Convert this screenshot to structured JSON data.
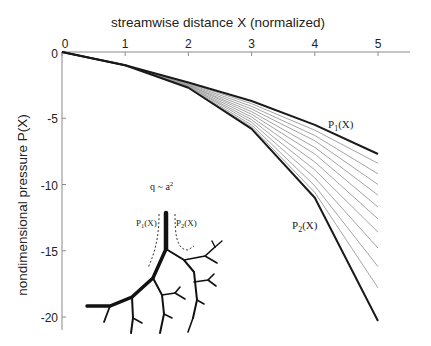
{
  "chart_data": {
    "type": "line",
    "title": "",
    "xlabel": "streamwise distance X (normalized)",
    "ylabel": "nondimensional pressure P(X)",
    "xlim": [
      0,
      5
    ],
    "ylim": [
      -21,
      0
    ],
    "x_ticks": [
      "0",
      "1",
      "2",
      "3",
      "4",
      "5"
    ],
    "y_ticks": [
      "0",
      "-5",
      "-10",
      "-15",
      "-20"
    ],
    "grid": false,
    "x_axis_position": "top",
    "x": [
      0,
      1,
      2,
      3,
      4,
      5
    ],
    "series": [
      {
        "name": "P1(X)",
        "style": "bold",
        "values": [
          0,
          -1.0,
          -2.3,
          -3.7,
          -5.5,
          -7.7
        ]
      },
      {
        "name": "intermediate-1",
        "style": "thin-gray",
        "values": [
          0,
          -1.0,
          -2.35,
          -3.9,
          -5.9,
          -8.4
        ]
      },
      {
        "name": "intermediate-2",
        "style": "thin-gray",
        "values": [
          0,
          -1.0,
          -2.4,
          -4.1,
          -6.3,
          -9.2
        ]
      },
      {
        "name": "intermediate-3",
        "style": "thin-gray",
        "values": [
          0,
          -1.0,
          -2.45,
          -4.3,
          -6.7,
          -10.0
        ]
      },
      {
        "name": "intermediate-4",
        "style": "thin-gray",
        "values": [
          0,
          -1.0,
          -2.5,
          -4.5,
          -7.2,
          -10.8
        ]
      },
      {
        "name": "intermediate-5",
        "style": "thin-gray",
        "values": [
          0,
          -1.0,
          -2.5,
          -4.7,
          -7.7,
          -11.7
        ]
      },
      {
        "name": "intermediate-6",
        "style": "thin-gray",
        "values": [
          0,
          -1.0,
          -2.55,
          -4.9,
          -8.3,
          -12.6
        ]
      },
      {
        "name": "intermediate-7",
        "style": "thin-gray",
        "values": [
          0,
          -1.0,
          -2.6,
          -5.1,
          -8.9,
          -13.6
        ]
      },
      {
        "name": "intermediate-8",
        "style": "thin-gray",
        "values": [
          0,
          -1.0,
          -2.6,
          -5.3,
          -9.5,
          -14.8
        ]
      },
      {
        "name": "intermediate-9",
        "style": "thin-gray",
        "values": [
          0,
          -1.0,
          -2.65,
          -5.5,
          -10.1,
          -16.2
        ]
      },
      {
        "name": "intermediate-10",
        "style": "thin-gray",
        "values": [
          0,
          -1.0,
          -2.7,
          -5.65,
          -10.6,
          -17.8
        ]
      },
      {
        "name": "P2(X)",
        "style": "bold",
        "values": [
          0,
          -1.0,
          -2.7,
          -5.8,
          -11.0,
          -20.3
        ]
      }
    ],
    "annotations": [
      {
        "text": "P1(X)",
        "x": 4.25,
        "y": -5.5
      },
      {
        "text": "P2(X)",
        "x": 3.7,
        "y": -13.5
      }
    ],
    "inset": {
      "description": "branching tree diagram",
      "label_top": "q ~ a²",
      "label_left": "P1(X)",
      "label_right": "P2(X)"
    }
  },
  "labels": {
    "xlabel": "streamwise distance X (normalized)",
    "ylabel": "nondimensional pressure P(X)",
    "p1": "P",
    "p1_sub": "1",
    "p1_tail": "(X)",
    "p2": "P",
    "p2_sub": "2",
    "p2_tail": "(X)",
    "inset_q": "q ~ a",
    "inset_q_sup": "2",
    "inset_p1": "P",
    "inset_p1_sub": "1",
    "inset_p1_tail": "(X)",
    "inset_p2": "P",
    "inset_p2_sub": "2",
    "inset_p2_tail": "(X)",
    "origin_zero": "0"
  },
  "colors": {
    "bold_line": "#1a1a1a",
    "thin_line": "#9a9a9a",
    "axis": "#8a8a8a",
    "text": "#222222"
  }
}
